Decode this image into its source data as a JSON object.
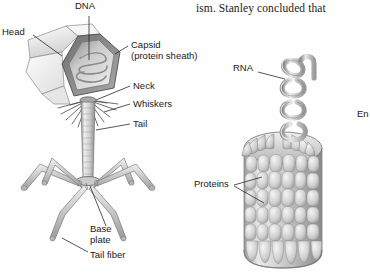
{
  "page": {
    "background_color": "#fefefe",
    "ink_color": "#1a1a1a",
    "figure_type": "virus-structure-illustration",
    "body_text": "ism. Stanley concluded that"
  },
  "bacteriophage": {
    "name": "bacteriophage-diagram",
    "labels": {
      "dna": "DNA",
      "head": "Head",
      "capsid_line1": "Capsid",
      "capsid_line2": "(protein sheath)",
      "neck": "Neck",
      "whiskers": "Whiskers",
      "tail": "Tail",
      "base_plate_line1": "Base",
      "base_plate_line2": "plate",
      "tail_fiber": "Tail fiber"
    },
    "colors": {
      "head_light": "#f2f2f2",
      "head_mid": "#d8d8d8",
      "head_dark": "#8d8d8d",
      "outline": "#5a5a5a",
      "sheath": "#cfcfcf",
      "leg": "#c8c8c8"
    },
    "leg_count": 6,
    "whisker_count": 14
  },
  "tmv": {
    "name": "tobacco-mosaic-virus-diagram",
    "labels": {
      "rna": "RNA",
      "proteins": "Proteins",
      "clipped_right": "En"
    },
    "colors": {
      "capsid_light": "#e4e4e4",
      "capsid_mid": "#bdbdbd",
      "capsid_dark": "#868686",
      "outline": "#6a6a6a",
      "rna_helix": "#b9b9b9"
    },
    "helix_turns": 4,
    "subunit_columns": 12,
    "subunit_rows": 7
  }
}
